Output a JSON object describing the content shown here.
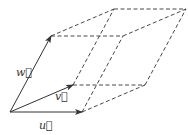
{
  "diagram": {
    "type": "parallelepiped",
    "colors": {
      "solid": "#333333",
      "dashed": "#333333",
      "background": "#ffffff"
    },
    "vertices": {
      "O": [
        10,
        112
      ],
      "u": [
        82,
        112
      ],
      "v": [
        73,
        85
      ],
      "w": [
        51,
        36
      ],
      "u_plus_v": [
        145,
        85
      ],
      "u_plus_w": [
        123,
        36
      ],
      "v_plus_w": [
        114,
        9
      ],
      "u_plus_v_plus_w": [
        186,
        9
      ]
    },
    "labels": {
      "u": "u⃗",
      "v": "v⃗",
      "w": "w⃗"
    }
  }
}
